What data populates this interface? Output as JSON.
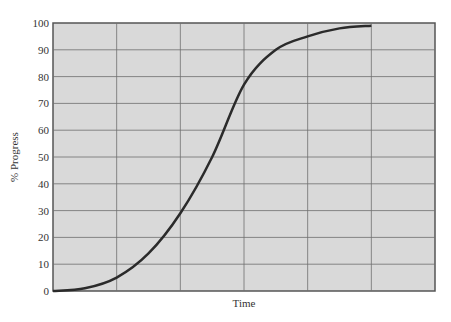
{
  "chart_data": {
    "type": "line",
    "title": "",
    "xlabel": "Time",
    "ylabel": "% Progress",
    "ylim": [
      0,
      100
    ],
    "xlim": [
      0,
      6
    ],
    "yticks": [
      0,
      10,
      20,
      30,
      40,
      50,
      60,
      70,
      80,
      90,
      100
    ],
    "xticks": [],
    "grid": true,
    "legend": null,
    "series": [
      {
        "name": "Progress",
        "x": [
          0,
          0.5,
          1,
          1.5,
          2,
          2.5,
          3,
          3.5,
          4,
          4.5,
          5
        ],
        "values": [
          0,
          1,
          5,
          14,
          29,
          50,
          77,
          90,
          95,
          98,
          99
        ]
      }
    ]
  },
  "colors": {
    "plot_bg": "#d9d9d9",
    "grid": "#6e6e6e",
    "line": "#2b2b2b"
  }
}
